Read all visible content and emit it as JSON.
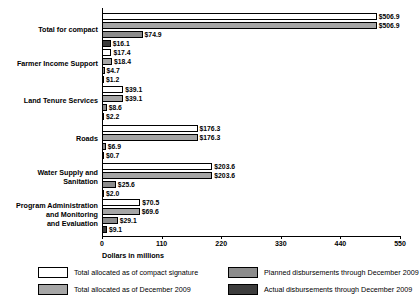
{
  "chart_data": {
    "type": "bar",
    "orientation": "horizontal",
    "title": "",
    "xlabel": "Dollars in millions",
    "ylabel": "",
    "xlim": [
      0,
      550
    ],
    "xticks": [
      0,
      110,
      220,
      330,
      440,
      550
    ],
    "xtick_labels": [
      "0",
      "110",
      "220",
      "330",
      "440",
      "550"
    ],
    "grid": false,
    "legend_position": "bottom",
    "categories": [
      "Total for compact",
      "Farmer Income Support",
      "Land Tenure Services",
      "Roads",
      "Water Supply and Sanitation",
      "Program Administration and Monitoring and Evaluation"
    ],
    "series": [
      {
        "name": "Total allocated as of compact signature",
        "color": "#ffffff",
        "values": [
          506.9,
          17.4,
          39.1,
          176.3,
          203.6,
          70.5
        ],
        "labels": [
          "$506.9",
          "$17.4",
          "$39.1",
          "$176.3",
          "$203.6",
          "$70.5"
        ]
      },
      {
        "name": "Total allocated as of December 2009",
        "color": "#a6a6a6",
        "values": [
          506.9,
          18.4,
          39.1,
          176.3,
          203.6,
          69.6
        ],
        "labels": [
          "$506.9",
          "$18.4",
          "$39.1",
          "$176.3",
          "$203.6",
          "$69.6"
        ]
      },
      {
        "name": "Planned disbursements through December 2009",
        "color": "#8c8c8c",
        "values": [
          74.9,
          4.7,
          8.6,
          6.9,
          25.6,
          29.1
        ],
        "labels": [
          "$74.9",
          "$4.7",
          "$8.6",
          "$6.9",
          "$25.6",
          "$29.1"
        ]
      },
      {
        "name": "Actual disbursements through December 2009",
        "color": "#3d3d3d",
        "values": [
          16.1,
          1.2,
          2.2,
          0.7,
          2.0,
          9.1
        ],
        "labels": [
          "$16.1",
          "$1.2",
          "$2.2",
          "$0.7",
          "$2.0",
          "$9.1"
        ]
      }
    ]
  },
  "legend": [
    {
      "label": "Total allocated as of compact signature",
      "swatch": "s0"
    },
    {
      "label": "Total allocated as of December 2009",
      "swatch": "s1"
    },
    {
      "label": "Planned disbursements through December 2009",
      "swatch": "s2"
    },
    {
      "label": "Actual disbursements through December 2009",
      "swatch": "s3"
    }
  ]
}
